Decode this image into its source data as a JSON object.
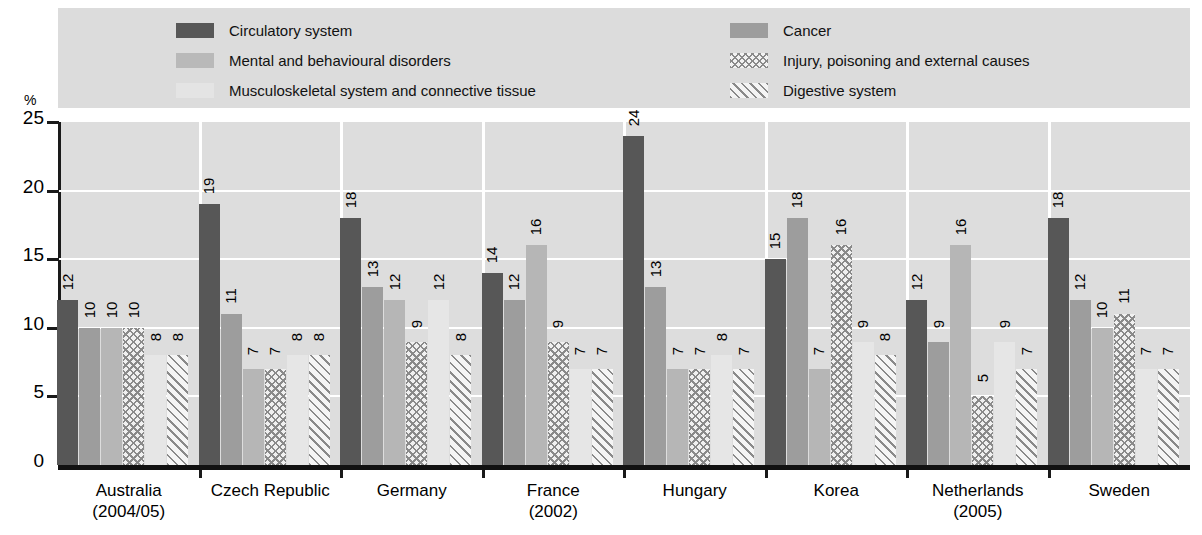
{
  "axis": {
    "unit_label": "%",
    "y_ticks": [
      "0",
      "5",
      "10",
      "15",
      "20",
      "25"
    ]
  },
  "legend": {
    "left": [
      {
        "label": "Circulatory system",
        "swatch": "solid-dark-gray",
        "key": "circulatory"
      },
      {
        "label": "Mental and behavioural disorders",
        "swatch": "solid-medium-gray",
        "key": "mental"
      },
      {
        "label": "Musculoskeletal system and connective tissue",
        "swatch": "solid-very-light-gray",
        "key": "musculoskeletal"
      }
    ],
    "right": [
      {
        "label": "Cancer",
        "swatch": "solid-gray",
        "key": "cancer"
      },
      {
        "label": "Injury, poisoning and external causes",
        "swatch": "cross-hatch",
        "key": "injury"
      },
      {
        "label": "Digestive system",
        "swatch": "diagonal-stripes",
        "key": "digestive"
      }
    ]
  },
  "chart_data": {
    "type": "bar",
    "title": "",
    "xlabel": "",
    "ylabel": "%",
    "ylim": [
      0,
      25
    ],
    "ytick_step": 5,
    "grid": true,
    "legend_position": "top",
    "categories": [
      "Australia",
      "Czech Republic",
      "Germany",
      "France",
      "Hungary",
      "Korea",
      "Netherlands",
      "Sweden"
    ],
    "category_years": [
      "(2004/05)",
      "",
      "",
      "(2002)",
      "",
      "",
      "(2005)",
      ""
    ],
    "series": [
      {
        "name": "Circulatory system",
        "pattern": "solid-dark-gray",
        "values": [
          12,
          19,
          18,
          14,
          24,
          15,
          12,
          18
        ]
      },
      {
        "name": "Cancer",
        "pattern": "solid-gray",
        "values": [
          10,
          11,
          13,
          12,
          13,
          18,
          9,
          12
        ]
      },
      {
        "name": "Mental and behavioural disorders",
        "pattern": "solid-medium-gray",
        "values": [
          10,
          7,
          12,
          16,
          7,
          7,
          16,
          10
        ]
      },
      {
        "name": "Injury, poisoning and external causes",
        "pattern": "cross-hatch",
        "values": [
          10,
          7,
          9,
          9,
          7,
          16,
          5,
          11
        ]
      },
      {
        "name": "Musculoskeletal system and connective tissue",
        "pattern": "solid-very-light-gray",
        "values": [
          8,
          8,
          12,
          7,
          8,
          9,
          9,
          7
        ]
      },
      {
        "name": "Digestive system",
        "pattern": "diagonal-stripes",
        "values": [
          8,
          8,
          8,
          7,
          7,
          8,
          7,
          7
        ]
      }
    ]
  },
  "colors": {
    "legend_band": "#dcdcdc",
    "plot_background": "#dddddd",
    "gridline": "#ffffff",
    "axis": "#1a1a1a",
    "circulatory": "#575757",
    "cancer": "#9d9d9d",
    "mental": "#b6b6b6",
    "musculoskeletal": "#e6e6e6",
    "hatch": "#8a8a8a"
  }
}
